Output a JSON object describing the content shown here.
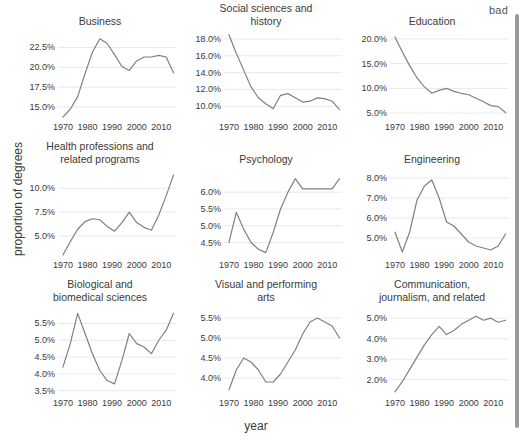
{
  "annotation": {
    "bad_label": "bad"
  },
  "axes": {
    "ylabel": "proportion of degrees",
    "xlabel": "year"
  },
  "scrollbar": {
    "name": "vertical-scrollbar"
  },
  "chart_data": {
    "type": "line",
    "title": "",
    "xlabel": "year",
    "ylabel": "proportion of degrees",
    "grid": true,
    "legend": "none",
    "layout": "3x3 small-multiples facet grid",
    "xlim": [
      1968,
      2016
    ],
    "xticks": [
      1970,
      1980,
      1990,
      2000,
      2010
    ],
    "xticklabels": [
      "1970",
      "1980",
      "1990",
      "2000",
      "2010"
    ],
    "facets": [
      {
        "title": "Business",
        "title_lines": [
          "Business"
        ],
        "ylim": [
          13.6,
          24.2
        ],
        "yticks": [
          15.0,
          17.5,
          20.0,
          22.5
        ],
        "yticklabels": [
          "15.0%",
          "17.5%",
          "20.0%",
          "22.5%"
        ],
        "x": [
          1970,
          1973,
          1976,
          1979,
          1982,
          1985,
          1988,
          1991,
          1994,
          1997,
          2000,
          2003,
          2006,
          2009,
          2012,
          2015
        ],
        "y": [
          13.7,
          14.7,
          16.3,
          19.2,
          21.9,
          23.6,
          23.0,
          21.6,
          20.1,
          19.6,
          20.8,
          21.3,
          21.3,
          21.5,
          21.3,
          19.3
        ]
      },
      {
        "title": "Social sciences and history",
        "title_lines": [
          "Social sciences and",
          "history"
        ],
        "ylim": [
          8.6,
          18.6
        ],
        "yticks": [
          10.0,
          12.0,
          14.0,
          16.0,
          18.0
        ],
        "yticklabels": [
          "10.0%",
          "12.0%",
          "14.0%",
          "16.0%",
          "18.0%"
        ],
        "x": [
          1970,
          1973,
          1976,
          1979,
          1982,
          1985,
          1988,
          1991,
          1994,
          1997,
          2000,
          2003,
          2006,
          2009,
          2012,
          2015
        ],
        "y": [
          18.5,
          16.3,
          14.3,
          12.3,
          11.0,
          10.3,
          9.7,
          11.3,
          11.5,
          11.0,
          10.5,
          10.6,
          11.0,
          10.9,
          10.6,
          9.6
        ]
      },
      {
        "title": "Education",
        "title_lines": [
          "Education"
        ],
        "ylim": [
          4.0,
          21.0
        ],
        "yticks": [
          5.0,
          10.0,
          15.0,
          20.0
        ],
        "yticklabels": [
          "5.0%",
          "10.0%",
          "15.0%",
          "20.0%"
        ],
        "x": [
          1970,
          1973,
          1976,
          1979,
          1982,
          1985,
          1988,
          1991,
          1994,
          1997,
          2000,
          2003,
          2006,
          2009,
          2012,
          2015
        ],
        "y": [
          20.4,
          17.4,
          14.6,
          12.1,
          10.3,
          9.0,
          9.6,
          10.0,
          9.4,
          9.0,
          8.7,
          8.0,
          7.3,
          6.5,
          6.3,
          5.1
        ]
      },
      {
        "title": "Health professions and related programs",
        "title_lines": [
          "Health professions and",
          "related programs"
        ],
        "ylim": [
          2.9,
          11.7
        ],
        "yticks": [
          5.0,
          7.5,
          10.0
        ],
        "yticklabels": [
          "5.0%",
          "7.5%",
          "10.0%"
        ],
        "x": [
          1970,
          1973,
          1976,
          1979,
          1982,
          1985,
          1988,
          1991,
          1994,
          1997,
          2000,
          2003,
          2006,
          2009,
          2012,
          2015
        ],
        "y": [
          3.0,
          4.4,
          5.7,
          6.5,
          6.8,
          6.7,
          6.0,
          5.5,
          6.4,
          7.5,
          6.4,
          5.9,
          5.6,
          7.2,
          9.2,
          11.4
        ]
      },
      {
        "title": "Psychology",
        "title_lines": [
          "Psychology"
        ],
        "ylim": [
          4.1,
          6.6
        ],
        "yticks": [
          4.5,
          5.0,
          5.5,
          6.0
        ],
        "yticklabels": [
          "4.5%",
          "5.0%",
          "5.5%",
          "6.0%"
        ],
        "x": [
          1970,
          1973,
          1976,
          1979,
          1982,
          1985,
          1988,
          1991,
          1994,
          1997,
          2000,
          2003,
          2006,
          2009,
          2012,
          2015
        ],
        "y": [
          4.5,
          5.4,
          4.9,
          4.5,
          4.3,
          4.2,
          4.8,
          5.5,
          6.0,
          6.4,
          6.1,
          6.1,
          6.1,
          6.1,
          6.1,
          6.4
        ]
      },
      {
        "title": "Engineering",
        "title_lines": [
          "Engineering"
        ],
        "ylim": [
          4.1,
          8.3
        ],
        "yticks": [
          5.0,
          6.0,
          7.0,
          8.0
        ],
        "yticklabels": [
          "5.0%",
          "6.0%",
          "7.0%",
          "8.0%"
        ],
        "x": [
          1970,
          1973,
          1976,
          1979,
          1982,
          1985,
          1988,
          1991,
          1994,
          1997,
          2000,
          2003,
          2006,
          2009,
          2012,
          2015
        ],
        "y": [
          5.3,
          4.3,
          5.3,
          6.9,
          7.6,
          7.9,
          7.0,
          5.8,
          5.6,
          5.2,
          4.8,
          4.6,
          4.5,
          4.4,
          4.6,
          5.2
        ]
      },
      {
        "title": "Biological and biomedical sciences",
        "title_lines": [
          "Biological and",
          "biomedical sciences"
        ],
        "ylim": [
          3.4,
          5.9
        ],
        "yticks": [
          3.5,
          4.0,
          4.5,
          5.0,
          5.5
        ],
        "yticklabels": [
          "3.5%",
          "4.0%",
          "4.5%",
          "5.0%",
          "5.5%"
        ],
        "x": [
          1970,
          1973,
          1976,
          1979,
          1982,
          1985,
          1988,
          1991,
          1994,
          1997,
          2000,
          2003,
          2006,
          2009,
          2012,
          2015
        ],
        "y": [
          4.2,
          4.9,
          5.8,
          5.2,
          4.6,
          4.1,
          3.8,
          3.7,
          4.4,
          5.2,
          4.9,
          4.8,
          4.6,
          5.0,
          5.3,
          5.8
        ]
      },
      {
        "title": "Visual and performing arts",
        "title_lines": [
          "Visual and performing",
          "arts"
        ],
        "ylim": [
          3.6,
          5.7
        ],
        "yticks": [
          4.0,
          4.5,
          5.0,
          5.5
        ],
        "yticklabels": [
          "4.0%",
          "4.5%",
          "5.0%",
          "5.5%"
        ],
        "x": [
          1970,
          1973,
          1976,
          1979,
          1982,
          1985,
          1988,
          1991,
          1994,
          1997,
          2000,
          2003,
          2006,
          2009,
          2012,
          2015
        ],
        "y": [
          3.7,
          4.2,
          4.5,
          4.4,
          4.2,
          3.9,
          3.9,
          4.1,
          4.4,
          4.7,
          5.1,
          5.4,
          5.5,
          5.4,
          5.3,
          5.0
        ]
      },
      {
        "title": "Communication, journalism, and related",
        "title_lines": [
          "Communication,",
          "journalism, and related"
        ],
        "ylim": [
          1.3,
          5.4
        ],
        "yticks": [
          2.0,
          3.0,
          4.0,
          5.0
        ],
        "yticklabels": [
          "2.0%",
          "3.0%",
          "4.0%",
          "5.0%"
        ],
        "x": [
          1970,
          1973,
          1976,
          1979,
          1982,
          1985,
          1988,
          1991,
          1994,
          1997,
          2000,
          2003,
          2006,
          2009,
          2012,
          2015
        ],
        "y": [
          1.4,
          1.9,
          2.5,
          3.1,
          3.7,
          4.2,
          4.6,
          4.2,
          4.4,
          4.7,
          4.9,
          5.1,
          4.9,
          5.0,
          4.8,
          4.9
        ]
      }
    ]
  },
  "colors": {
    "line": "#808080",
    "grid": "#e8e8e8",
    "text": "#3a3a3a",
    "background": "#ffffff",
    "scrollbar": "#9a9a9a"
  }
}
